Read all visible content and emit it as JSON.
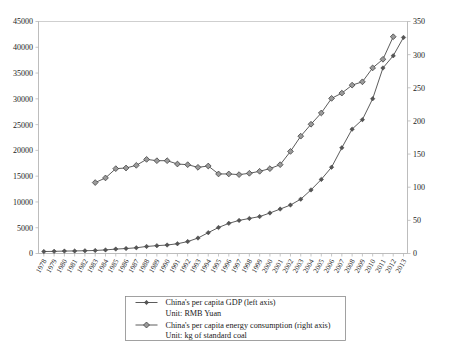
{
  "chart_data": {
    "type": "line",
    "title": "",
    "subtitle": "",
    "xlabel": "",
    "ylabel": "",
    "grid": false,
    "legend_position": "bottom",
    "categories": [
      "1978",
      "1979",
      "1980",
      "1981",
      "1982",
      "1983",
      "1984",
      "1985",
      "1986",
      "1987",
      "1988",
      "1989",
      "1990",
      "1991",
      "1992",
      "1993",
      "1994",
      "1995",
      "1996",
      "1997",
      "1998",
      "1999",
      "2000",
      "2001",
      "2002",
      "2003",
      "2004",
      "2005",
      "2006",
      "2007",
      "2008",
      "2009",
      "2010",
      "2011",
      "2012",
      "2013"
    ],
    "axes": {
      "left": {
        "label": "",
        "unit": "RMB Yuan",
        "min": 0,
        "max": 45000,
        "step": 5000,
        "ticks": [
          "0",
          "5000",
          "10000",
          "15000",
          "20000",
          "25000",
          "30000",
          "35000",
          "40000",
          "45000"
        ]
      },
      "right": {
        "label": "",
        "unit": "kg of standard coal",
        "min": 0,
        "max": 350,
        "step": 50,
        "ticks": [
          "0",
          "50",
          "100",
          "150",
          "200",
          "250",
          "300",
          "350"
        ]
      }
    },
    "series": [
      {
        "name": "China's per capita GDP (left axis)",
        "unit_line": "Unit: RMB Yuan",
        "axis": "left",
        "marker": "dot",
        "color": "#4a4a4a",
        "values": [
          385,
          420,
          468,
          498,
          533,
          588,
          695,
          858,
          963,
          1112,
          1366,
          1519,
          1644,
          1893,
          2311,
          2998,
          4044,
          5046,
          5846,
          6420,
          6796,
          7159,
          7858,
          8622,
          9398,
          10542,
          12336,
          14368,
          16738,
          20505,
          24121,
          25963,
          30015,
          35983,
          38354,
          41908
        ]
      },
      {
        "name": "China's per capita energy consumption (right axis)",
        "unit_line": "Unit: kg of standard coal",
        "axis": "right",
        "marker": "diamond",
        "color": "#4a4a4a",
        "values": [
          null,
          null,
          null,
          null,
          null,
          107,
          114,
          128,
          129,
          133,
          142,
          140,
          140,
          135,
          134,
          130,
          132,
          120,
          120,
          119,
          121,
          124,
          128,
          134,
          154,
          177,
          195,
          212,
          234,
          242,
          254,
          259,
          280,
          293,
          327,
          null
        ]
      }
    ]
  },
  "legend": {
    "entries": [
      {
        "label": "China's per capita GDP (left axis)",
        "unit": "Unit: RMB Yuan",
        "marker": "dot"
      },
      {
        "label": "China's per capita energy consumption (right axis)",
        "unit": "Unit: kg of standard coal",
        "marker": "diamond"
      }
    ]
  }
}
